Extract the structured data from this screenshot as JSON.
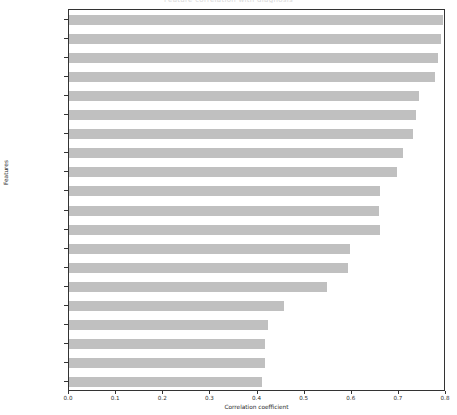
{
  "figure": {
    "title": "Feature correlation with diagnosis",
    "xaxis_label": "Correlation coefficient",
    "yaxis_label": "Features",
    "bar_color": "#c0c0c0",
    "axis_color": "#333333",
    "xticks": [
      "0.0",
      "0.1",
      "0.2",
      "0.3",
      "0.4",
      "0.5",
      "0.6",
      "0.7",
      "0.8"
    ]
  },
  "chart_data": {
    "type": "bar",
    "orientation": "horizontal",
    "title": "Feature correlation with diagnosis",
    "xlabel": "Correlation coefficient",
    "ylabel": "Features",
    "xlim": [
      0.0,
      0.8
    ],
    "grid": false,
    "legend": null,
    "categories": [
      "concave points_worst",
      "area_worst",
      "perimeter_worst",
      "radius_worst",
      "perimeter_mean",
      "concave points_mean",
      "radius_mean",
      "area_mean",
      "concavity_mean",
      "perimeter_se",
      "radius_se",
      "concavity_worst",
      "compactness_mean",
      "compactness_worst",
      "area_se",
      "texture_worst",
      "smoothness_worst",
      "symmetry_worst",
      "texture_mean",
      "concavity_se"
    ],
    "values": [
      0.794,
      0.789,
      0.783,
      0.777,
      0.743,
      0.737,
      0.73,
      0.709,
      0.696,
      0.661,
      0.657,
      0.66,
      0.597,
      0.591,
      0.548,
      0.457,
      0.422,
      0.416,
      0.415,
      0.41
    ]
  }
}
